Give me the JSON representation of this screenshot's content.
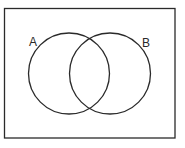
{
  "diagram": {
    "type": "venn",
    "universe": {
      "x": 4,
      "y": 8,
      "width": 171,
      "height": 130
    },
    "sets": [
      {
        "label": "A",
        "cx": 69,
        "cy": 73,
        "r": 40,
        "label_x": 30,
        "label_y": 46
      },
      {
        "label": "B",
        "cx": 110,
        "cy": 73,
        "r": 40,
        "label_x": 142,
        "label_y": 47
      }
    ],
    "stroke_color": "#2a2a2a"
  }
}
